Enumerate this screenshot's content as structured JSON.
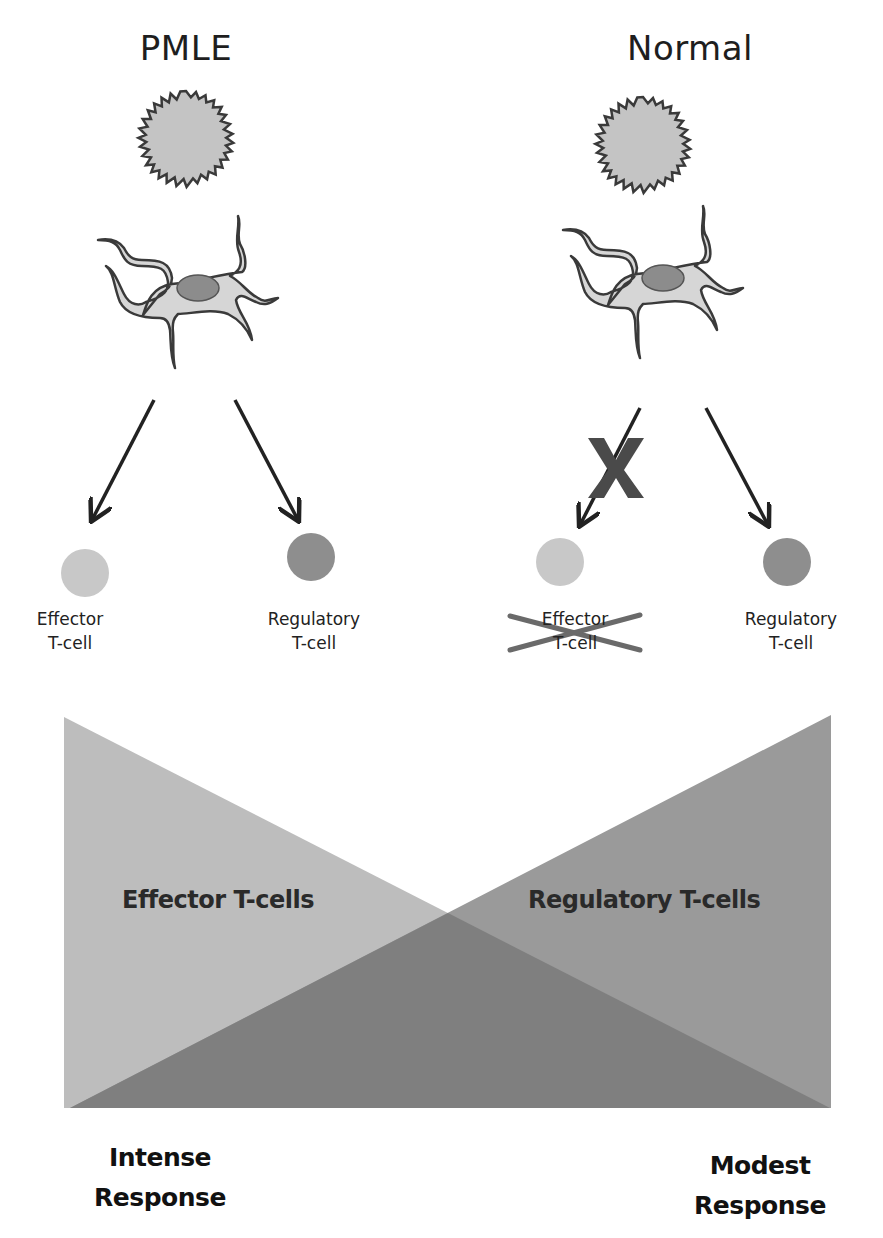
{
  "panels": {
    "left": {
      "title": "PMLE",
      "effector_label_line1": "Effector",
      "effector_label_line2": "T-cell",
      "regulatory_label_line1": "Regulatory",
      "regulatory_label_line2": "T-cell",
      "effector_blocked": false
    },
    "right": {
      "title": "Normal",
      "effector_label_line1": "Effector",
      "effector_label_line2": "T-cell",
      "regulatory_label_line1": "Regulatory",
      "regulatory_label_line2": "T-cell",
      "effector_blocked": true,
      "block_mark": "X"
    }
  },
  "balance": {
    "left_triangle_label": "Effector T-cells",
    "right_triangle_label": "Regulatory T-cells",
    "left_response_line1": "Intense",
    "left_response_line2": "Response",
    "right_response_line1": "Modest",
    "right_response_line2": "Response"
  },
  "colors": {
    "background": "#ffffff",
    "effector_cell": "#c8c8c8",
    "regulatory_cell": "#8e8e8e",
    "left_triangle": "#bdbdbd",
    "right_triangle": "#9a9a9a",
    "overlap_region": "#7f7f7f",
    "dendritic_cell_body": "#d6d6d6",
    "nucleus": "#8c8c8c",
    "uv_sun_fill": "#c4c4c4",
    "outline": "#3a3a3a",
    "block_mark": "#4a4a4a"
  },
  "icons": {
    "uv_source": "starburst-sun-icon",
    "antigen_presenting_cell": "dendritic-cell-icon",
    "arrow": "arrow-down-icon"
  }
}
